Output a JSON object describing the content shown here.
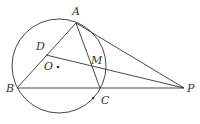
{
  "diagram": {
    "type": "geometry",
    "stroke_color": "#333333",
    "circle": {
      "name": "O",
      "cx": 59,
      "cy": 66,
      "r": 47
    },
    "points": {
      "A": {
        "x": 76,
        "y": 23,
        "label": "A",
        "lx": 72,
        "ly": 15
      },
      "B": {
        "x": 17,
        "y": 88,
        "label": "B",
        "lx": 6,
        "ly": 92
      },
      "C": {
        "x": 100,
        "y": 88,
        "label": "C",
        "lx": 101,
        "ly": 104
      },
      "P": {
        "x": 184,
        "y": 88,
        "label": "P",
        "lx": 187,
        "ly": 92
      },
      "D": {
        "x": 46,
        "y": 55,
        "label": "D",
        "lx": 36,
        "ly": 50
      },
      "M": {
        "x": 92,
        "y": 67,
        "label": "M",
        "lx": 91,
        "ly": 64
      },
      "O": {
        "x": 58,
        "y": 67,
        "label": "O",
        "lx": 44,
        "ly": 70
      }
    },
    "dots": [
      {
        "name": "center-O",
        "x": 58,
        "y": 67
      },
      {
        "name": "arc-point",
        "x": 93,
        "y": 98
      }
    ],
    "segments": [
      [
        "A",
        "B"
      ],
      [
        "A",
        "C"
      ],
      [
        "B",
        "P"
      ],
      [
        "A",
        "P"
      ],
      [
        "D",
        "P"
      ]
    ]
  }
}
